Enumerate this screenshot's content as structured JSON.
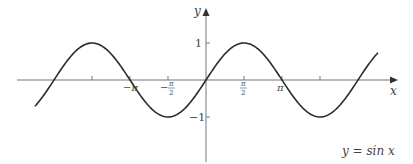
{
  "chart_data": {
    "type": "line",
    "title": "",
    "annotation": "y = sin x",
    "xlabel": "x",
    "ylabel": "y",
    "function": "sin",
    "x_range_rad": [
      -7.07,
      7.11
    ],
    "ylim": [
      -1,
      1
    ],
    "grid": false,
    "legend": "none",
    "x_ticks": [
      {
        "value_rad": -4.712,
        "label": ""
      },
      {
        "value_rad": -3.1416,
        "label": "−π"
      },
      {
        "value_rad": -1.5708,
        "label": "−π/2"
      },
      {
        "value_rad": 1.5708,
        "label": "π/2"
      },
      {
        "value_rad": 3.1416,
        "label": "π"
      },
      {
        "value_rad": 4.712,
        "label": ""
      }
    ],
    "y_ticks": [
      {
        "value": 1,
        "label": "1"
      },
      {
        "value": -1,
        "label": "−1"
      }
    ],
    "series": [
      {
        "name": "sin x",
        "x": [
          -6.2832,
          -4.7124,
          -3.1416,
          -1.5708,
          0,
          1.5708,
          3.1416,
          4.7124,
          6.2832
        ],
        "values": [
          0,
          1,
          0,
          -1,
          0,
          1,
          0,
          -1,
          0
        ]
      }
    ],
    "colors": {
      "curve": "#2a2a2a",
      "axis": "#777777",
      "text": "#444444"
    }
  },
  "labels": {
    "y_axis": "y",
    "x_axis": "x",
    "y_one": "1",
    "y_neg_one": "−1",
    "neg_pi": "−π",
    "neg_half_pi_minus": "−",
    "pi_sym": "π",
    "two": "2",
    "pi": "π",
    "equation": "y = sin x"
  }
}
